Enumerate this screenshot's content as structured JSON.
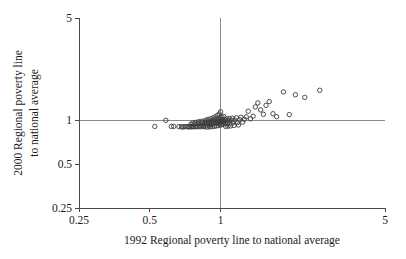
{
  "chart_data": {
    "type": "scatter",
    "title": "",
    "subtitle": "",
    "xlabel": "1992 Regional poverty line to national average",
    "ylabel_line1": "2000 Regional poverty line",
    "ylabel_line2": "to national average",
    "xscale": "log",
    "yscale": "log",
    "xlim": [
      0.25,
      5
    ],
    "ylim": [
      0.25,
      5
    ],
    "xticks": [
      0.25,
      0.5,
      1,
      5
    ],
    "xticklabels": [
      "0.25",
      "0.5",
      "1",
      "5"
    ],
    "yticks": [
      0.25,
      0.5,
      1,
      5
    ],
    "yticklabels": [
      "0.25",
      "0.5",
      "1",
      "5"
    ],
    "grid": false,
    "legend": null,
    "reference_lines": [
      {
        "orientation": "horizontal",
        "value": 1,
        "label": "y = 1"
      },
      {
        "orientation": "vertical",
        "value": 1,
        "label": "x = 1"
      }
    ],
    "marker": "open-circle",
    "marker_size": 3,
    "marker_color": "#3c3c3c",
    "point_count": 118,
    "points": [
      [
        0.525,
        0.905
      ],
      [
        0.585,
        0.995
      ],
      [
        0.617,
        0.905
      ],
      [
        0.632,
        0.905
      ],
      [
        0.665,
        0.902
      ],
      [
        0.682,
        0.9
      ],
      [
        0.69,
        0.898
      ],
      [
        0.7,
        0.9
      ],
      [
        0.712,
        0.903
      ],
      [
        0.726,
        0.899
      ],
      [
        0.733,
        0.9
      ],
      [
        0.74,
        0.902
      ],
      [
        0.748,
        0.938
      ],
      [
        0.75,
        0.9
      ],
      [
        0.757,
        0.901
      ],
      [
        0.762,
        0.955
      ],
      [
        0.766,
        0.902
      ],
      [
        0.772,
        0.94
      ],
      [
        0.778,
        0.9
      ],
      [
        0.783,
        0.962
      ],
      [
        0.79,
        0.905
      ],
      [
        0.795,
        0.945
      ],
      [
        0.8,
        0.9
      ],
      [
        0.805,
        0.975
      ],
      [
        0.812,
        0.908
      ],
      [
        0.818,
        0.95
      ],
      [
        0.822,
        0.902
      ],
      [
        0.828,
        0.98
      ],
      [
        0.834,
        0.91
      ],
      [
        0.84,
        0.955
      ],
      [
        0.845,
        0.903
      ],
      [
        0.85,
        0.985
      ],
      [
        0.855,
        0.932
      ],
      [
        0.86,
        0.9
      ],
      [
        0.864,
        0.965
      ],
      [
        0.868,
        1.0
      ],
      [
        0.872,
        0.915
      ],
      [
        0.876,
        0.948
      ],
      [
        0.88,
        0.896
      ],
      [
        0.884,
        0.975
      ],
      [
        0.888,
        1.01
      ],
      [
        0.892,
        0.925
      ],
      [
        0.896,
        0.955
      ],
      [
        0.9,
        0.9
      ],
      [
        0.904,
        0.985
      ],
      [
        0.908,
        1.02
      ],
      [
        0.912,
        0.935
      ],
      [
        0.916,
        0.962
      ],
      [
        0.92,
        0.902
      ],
      [
        0.924,
        0.995
      ],
      [
        0.928,
        1.035
      ],
      [
        0.932,
        0.942
      ],
      [
        0.936,
        0.97
      ],
      [
        0.94,
        0.906
      ],
      [
        0.944,
        1.005
      ],
      [
        0.948,
        1.05
      ],
      [
        0.952,
        0.948
      ],
      [
        0.956,
        0.978
      ],
      [
        0.96,
        0.912
      ],
      [
        0.964,
        1.015
      ],
      [
        0.968,
        1.075
      ],
      [
        0.97,
        0.955
      ],
      [
        0.974,
        0.985
      ],
      [
        0.978,
        0.918
      ],
      [
        0.982,
        1.025
      ],
      [
        0.986,
        1.1
      ],
      [
        0.988,
        0.96
      ],
      [
        0.992,
        0.992
      ],
      [
        0.995,
        0.925
      ],
      [
        0.998,
        1.04
      ],
      [
        1.0,
        1.14
      ],
      [
        1.002,
        0.968
      ],
      [
        1.005,
        1.0
      ],
      [
        1.008,
        0.93
      ],
      [
        1.012,
        1.052
      ],
      [
        1.016,
        0.975
      ],
      [
        1.02,
        1.005
      ],
      [
        1.024,
        0.936
      ],
      [
        1.03,
        1.06
      ],
      [
        1.035,
        0.98
      ],
      [
        1.04,
        1.01
      ],
      [
        1.045,
        0.942
      ],
      [
        1.05,
        0.905
      ],
      [
        1.056,
        0.985
      ],
      [
        1.062,
        1.018
      ],
      [
        1.068,
        0.948
      ],
      [
        1.074,
        0.908
      ],
      [
        1.08,
        0.99
      ],
      [
        1.088,
        1.025
      ],
      [
        1.095,
        0.952
      ],
      [
        1.102,
        0.912
      ],
      [
        1.11,
        0.996
      ],
      [
        1.12,
        1.03
      ],
      [
        1.13,
        0.958
      ],
      [
        1.14,
        0.918
      ],
      [
        1.152,
        1.0
      ],
      [
        1.165,
        1.038
      ],
      [
        1.178,
        0.962
      ],
      [
        1.19,
        0.925
      ],
      [
        1.205,
        1.005
      ],
      [
        1.22,
        1.045
      ],
      [
        1.24,
        0.968
      ],
      [
        1.262,
        1.012
      ],
      [
        1.285,
        1.052
      ],
      [
        1.31,
        1.15
      ],
      [
        1.34,
        1.02
      ],
      [
        1.375,
        1.062
      ],
      [
        1.405,
        1.23
      ],
      [
        1.44,
        1.31
      ],
      [
        1.48,
        1.175
      ],
      [
        1.52,
        1.095
      ],
      [
        1.56,
        1.26
      ],
      [
        1.61,
        1.34
      ],
      [
        1.67,
        1.105
      ],
      [
        1.73,
        1.055
      ],
      [
        1.85,
        1.56
      ],
      [
        2.08,
        1.49
      ],
      [
        2.28,
        1.43
      ],
      [
        2.64,
        1.6
      ],
      [
        1.96,
        1.09
      ]
    ]
  },
  "plot_area": {
    "left_px": 79,
    "right_px": 385,
    "top_px": 18,
    "bottom_px": 208
  }
}
